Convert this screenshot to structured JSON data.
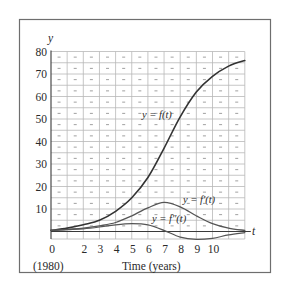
{
  "chart_data": {
    "type": "line",
    "title": "",
    "xlabel": "Time (years)",
    "xlabel_sub": "(1980)",
    "ylabel": "y",
    "t_axis_label": "t",
    "xlim": [
      0,
      12
    ],
    "ylim": [
      -3.5,
      80
    ],
    "grid": true,
    "x_tick_labels": [
      "0",
      "2",
      "3",
      "4",
      "5",
      "6",
      "7",
      "8",
      "9",
      "10"
    ],
    "x_tick_values": [
      0,
      2,
      3,
      4,
      5,
      6,
      7,
      8,
      9,
      10
    ],
    "y_tick_labels": [
      "10",
      "20",
      "30",
      "40",
      "50",
      "60",
      "70",
      "80"
    ],
    "y_tick_values": [
      10,
      20,
      30,
      40,
      50,
      60,
      70,
      80
    ],
    "x": [
      0,
      1,
      2,
      3,
      4,
      5,
      6,
      7,
      8,
      9,
      10,
      11,
      12
    ],
    "series": [
      {
        "name": "y = f(t)",
        "label": "y = f(t)",
        "color": "#333333",
        "values": [
          0.5,
          1.5,
          3,
          5,
          9,
          15,
          24,
          37,
          51,
          62,
          69,
          73.5,
          76
        ]
      },
      {
        "name": "y = f'(t)",
        "label": "y = f′(t)",
        "color": "#555555",
        "values": [
          0.5,
          1,
          1.5,
          2.5,
          4,
          7,
          10.5,
          13,
          11,
          7,
          3.5,
          1.5,
          0.5
        ]
      },
      {
        "name": "y = f''(t)",
        "label": "y = f″(t)",
        "color": "#555555",
        "values": [
          0.5,
          0.8,
          1.2,
          2,
          3,
          3.5,
          3,
          0.5,
          -2.5,
          -3.5,
          -3,
          -1.5,
          -0.5
        ]
      }
    ],
    "legend": "inline labels next to curves"
  }
}
